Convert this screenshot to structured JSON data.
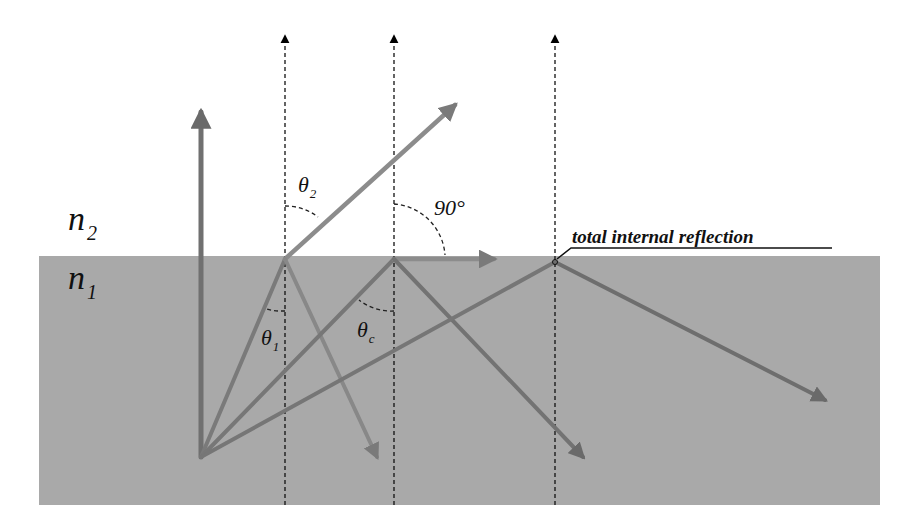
{
  "colors": {
    "background": "#ffffff",
    "medium_n1": "#a9a9a9",
    "incident_ray": "#7d7d7d",
    "refracted_ray": "#8a8a8a",
    "normal_ray": "#6f6f6f",
    "reflected_ray": "#777777",
    "dashed_normal": "#111111",
    "text": "#111111"
  },
  "media": {
    "upper": {
      "label": "n",
      "subscript": "2"
    },
    "lower": {
      "label": "n",
      "subscript": "1"
    }
  },
  "angles": {
    "theta2": {
      "symbol": "θ",
      "subscript": "2"
    },
    "theta1": {
      "symbol": "θ",
      "subscript": "1"
    },
    "thetac": {
      "symbol": "θ",
      "subscript": "c"
    },
    "right_angle": "90°"
  },
  "annotations": {
    "tir_label": "total internal reflection"
  },
  "rays": [
    {
      "name": "normal-incidence",
      "from": [
        201,
        457
      ],
      "to": [
        201,
        95
      ]
    },
    {
      "name": "incident-1",
      "from": [
        201,
        457
      ],
      "to": [
        285,
        259
      ]
    },
    {
      "name": "refracted-1",
      "from": [
        285,
        259
      ],
      "to": [
        465,
        96
      ]
    },
    {
      "name": "reflected-1",
      "from": [
        285,
        259
      ],
      "to": [
        383,
        470
      ]
    },
    {
      "name": "incident-critical",
      "from": [
        201,
        457
      ],
      "to": [
        394,
        259
      ]
    },
    {
      "name": "refracted-grazing",
      "from": [
        394,
        259
      ],
      "to": [
        508,
        259
      ]
    },
    {
      "name": "reflected-critical",
      "from": [
        394,
        259
      ],
      "to": [
        592,
        468
      ]
    },
    {
      "name": "incident-tir",
      "from": [
        201,
        457
      ],
      "to": [
        555,
        262
      ]
    },
    {
      "name": "reflected-tir",
      "from": [
        555,
        262
      ],
      "to": [
        838,
        407
      ]
    }
  ],
  "normals_x": [
    285,
    394,
    555
  ]
}
